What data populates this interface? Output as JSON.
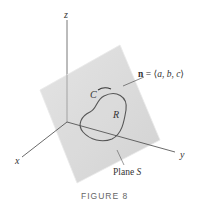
{
  "figure": {
    "caption": "FIGURE 8",
    "axes": {
      "x_label": "x",
      "y_label": "y",
      "z_label": "z"
    },
    "labels": {
      "curve": "C",
      "region": "R",
      "normal_bold": "n",
      "normal_eq": " = ⟨",
      "normal_a": "a",
      "normal_comma1": ", ",
      "normal_b": "b",
      "normal_comma2": ", ",
      "normal_c": "c",
      "normal_close": "⟩",
      "plane_word": "Plane ",
      "plane_symbol": "S"
    },
    "colors": {
      "plane_fill": "#d9d9d9",
      "plane_edge": "#e6e6e6",
      "axis": "#444444",
      "curve": "#555555",
      "caption": "#666666"
    }
  }
}
